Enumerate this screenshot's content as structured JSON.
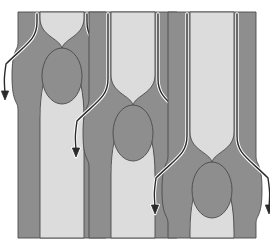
{
  "figure": {
    "title": "Venous valve flow sequence",
    "background_color": "#ffffff",
    "canvas": {
      "width": 270,
      "height": 249
    }
  },
  "style": {
    "wall_color": "#8e8e8e",
    "wall_color_dark": "#878787",
    "lumen_color": "#dcdcdc",
    "valve_fill": "#8e8e8e",
    "outline_color": "#4a4a4a",
    "arrow_color": "#2a2a2a",
    "arrow_halo_color": "#ffffff",
    "outline_width": 0.9,
    "arrow_width": 1.4,
    "arrow_halo_width": 3.4
  },
  "panels": [
    {
      "id": "panel-left",
      "label": "Valve high",
      "center_x": 62,
      "tube_top": 12,
      "tube_bottom": 238,
      "wall_outer_half": 44,
      "lumen_half": 22,
      "valve_center_y": 76,
      "valve_rx": 20,
      "valve_ry": 28,
      "bulge_half": 50,
      "neck_y": 48,
      "arrow_tip_y": 100,
      "arrow_start_y": 14
    },
    {
      "id": "panel-middle",
      "label": "Valve middle",
      "center_x": 133,
      "tube_top": 12,
      "tube_bottom": 238,
      "wall_outer_half": 44,
      "lumen_half": 22,
      "valve_center_y": 133,
      "valve_rx": 20,
      "valve_ry": 28,
      "bulge_half": 50,
      "neck_y": 105,
      "arrow_tip_y": 157,
      "arrow_start_y": 14
    },
    {
      "id": "panel-right",
      "label": "Valve low",
      "center_x": 212,
      "tube_top": 12,
      "tube_bottom": 238,
      "wall_outer_half": 44,
      "lumen_half": 22,
      "valve_center_y": 190,
      "valve_rx": 20,
      "valve_ry": 28,
      "bulge_half": 50,
      "neck_y": 162,
      "arrow_tip_y": 214,
      "arrow_start_y": 14
    }
  ],
  "chart_data": {
    "type": "diagram",
    "title": "Venous valve flow sequence",
    "categories": [
      "Valve high",
      "Valve middle",
      "Valve low"
    ],
    "values": [
      76,
      133,
      190
    ],
    "xlabel": "",
    "ylabel": "Valve centre height (px from top)",
    "series": [
      {
        "name": "valve_center_y",
        "values": [
          76,
          133,
          190
        ]
      },
      {
        "name": "arrow_tip_y",
        "values": [
          100,
          157,
          214
        ]
      },
      {
        "name": "neck_y",
        "values": [
          48,
          105,
          162
        ]
      }
    ],
    "annotations": [
      "Vessel walls shaded mid grey, lumen light grey",
      "Valve shown as an ellipse spanning the lumen",
      "Two outward-curving flow arrows per panel"
    ]
  }
}
